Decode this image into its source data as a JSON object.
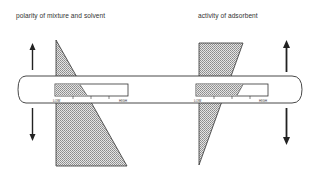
{
  "diagram": {
    "left_panel": {
      "title": "polarity of mixture and solvent",
      "scale": {
        "low_label": "LOW",
        "high_label": "HIGH",
        "fill_fraction": 0.44
      },
      "arrows": [
        "up",
        "down"
      ]
    },
    "right_panel": {
      "title": "activity of adsorbent",
      "scale": {
        "low_label": "LOW",
        "high_label": "HIGH",
        "fill_fraction": 0.72
      },
      "arrows": [
        "up",
        "down"
      ]
    },
    "colors": {
      "line": "#222222",
      "shade": "#cfcfcf",
      "background": "#ffffff"
    }
  }
}
